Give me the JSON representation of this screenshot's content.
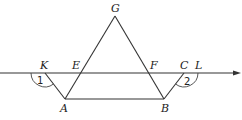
{
  "figure": {
    "type": "geometry",
    "colors": {
      "stroke": "#333333",
      "text": "#222222",
      "background": "#ffffff"
    },
    "points": {
      "G": {
        "label": "G",
        "x": 115,
        "y": 16
      },
      "A": {
        "label": "A",
        "x": 65,
        "y": 99
      },
      "B": {
        "label": "B",
        "x": 164,
        "y": 99
      },
      "E": {
        "label": "E",
        "x": 81,
        "y": 73
      },
      "F": {
        "label": "F",
        "x": 149,
        "y": 73
      },
      "K": {
        "label": "K",
        "x": 45,
        "y": 73
      },
      "C": {
        "label": "C",
        "x": 184,
        "y": 73
      },
      "L": {
        "label": "L"
      }
    },
    "angles": {
      "angle1": {
        "label": "1"
      },
      "angle2": {
        "label": "2"
      }
    },
    "segments": [
      "GA",
      "GB",
      "AB",
      "KA",
      "CB"
    ],
    "ray": "horizontal line through K, E, F, C, L with arrow to the right"
  }
}
